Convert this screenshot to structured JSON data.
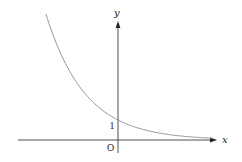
{
  "chart_data": {
    "type": "line",
    "title": "",
    "xlabel": "x",
    "ylabel": "y",
    "origin_label": "O",
    "y_tick_labels": [
      "1"
    ],
    "y_intercept": 1,
    "function": "y = a^x, 0 < a < 1 (decreasing exponential, passes through (0, 1))",
    "series": [
      {
        "name": "y = a^x",
        "x": [
          -3.6,
          -3,
          -2,
          -1,
          0,
          1,
          2,
          3,
          4,
          4.75
        ],
        "y": [
          6.28,
          4.63,
          2.78,
          1.67,
          1.0,
          0.6,
          0.36,
          0.22,
          0.13,
          0.09
        ]
      }
    ],
    "xlim": [
      -5,
      5
    ],
    "ylim": [
      -0.6,
      6.2
    ],
    "grid": false,
    "legend": false
  },
  "colors": {
    "axis": "#222222",
    "curve": "#8a8a8a",
    "background": "#ffffff"
  }
}
